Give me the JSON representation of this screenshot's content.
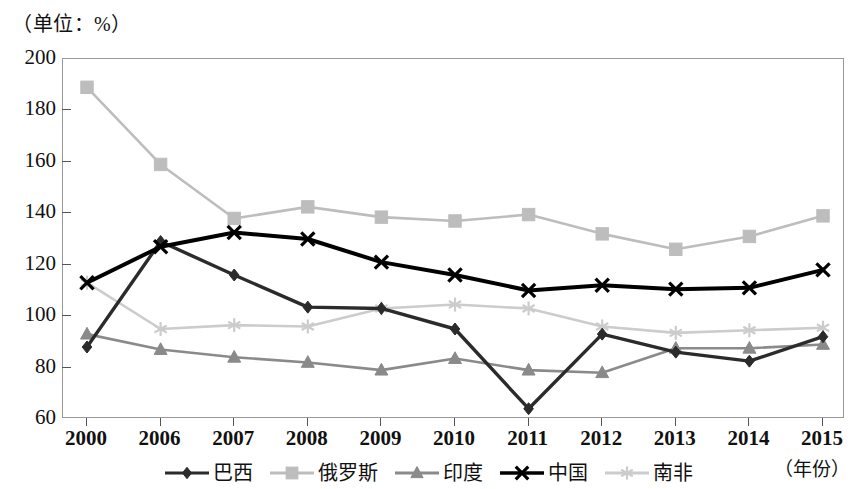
{
  "unit_caption": "（单位：%）",
  "year_caption": "（年份）",
  "axes": {
    "y_ticks": [
      "200",
      "180",
      "160",
      "140",
      "120",
      "100",
      "80",
      "60"
    ],
    "x_ticks": [
      "2000",
      "2006",
      "2007",
      "2008",
      "2009",
      "2010",
      "2011",
      "2012",
      "2013",
      "2014",
      "2015"
    ]
  },
  "legend": {
    "items": [
      {
        "label": "巴西",
        "marker": "diamond-marker",
        "color": "#2b2b2b"
      },
      {
        "label": "俄罗斯",
        "marker": "square-marker",
        "color": "#bdbdbd"
      },
      {
        "label": "印度",
        "marker": "triangle-marker",
        "color": "#8a8a8a"
      },
      {
        "label": "中国",
        "marker": "x-marker",
        "color": "#000000"
      },
      {
        "label": "南非",
        "marker": "asterisk-marker",
        "color": "#cccccc"
      }
    ]
  },
  "chart_data": {
    "type": "line",
    "title": "",
    "subtitle": "",
    "xlabel": "（年份）",
    "ylabel": "（单位：%）",
    "categories": [
      "2000",
      "2006",
      "2007",
      "2008",
      "2009",
      "2010",
      "2011",
      "2012",
      "2013",
      "2014",
      "2015"
    ],
    "ylim": [
      60,
      200
    ],
    "ytick_step": 20,
    "grid": false,
    "legend_position": "bottom",
    "series": [
      {
        "name": "巴西",
        "color": "#2b2b2b",
        "marker": "diamond",
        "values": [
          88,
          129,
          116,
          103.5,
          103,
          95,
          64,
          93,
          86,
          82.5,
          92
        ]
      },
      {
        "name": "俄罗斯",
        "color": "#bdbdbd",
        "marker": "square",
        "values": [
          189,
          159,
          138,
          142.5,
          138.5,
          137,
          139.5,
          132,
          126,
          131,
          139
        ]
      },
      {
        "name": "印度",
        "color": "#8a8a8a",
        "marker": "triangle",
        "values": [
          93,
          87,
          84,
          82,
          79,
          83.5,
          79,
          78,
          87.5,
          87.5,
          89
        ]
      },
      {
        "name": "中国",
        "color": "#000000",
        "marker": "x",
        "values": [
          113,
          127,
          132.5,
          130,
          121,
          116,
          110,
          112,
          110.5,
          111,
          118
        ]
      },
      {
        "name": "南非",
        "color": "#cccccc",
        "marker": "asterisk",
        "values": [
          113,
          95,
          96.5,
          96,
          103,
          104.5,
          103,
          96,
          93.5,
          94.5,
          95.5
        ]
      }
    ]
  }
}
